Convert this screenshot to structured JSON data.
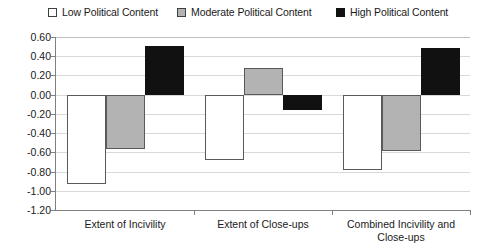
{
  "chart_data": {
    "type": "bar",
    "title": "",
    "subtitle": "",
    "xlabel": "",
    "ylabel": "",
    "categories": [
      "Extent of Incivility",
      "Extent of Close-ups",
      "Combined Incivility and Close-ups"
    ],
    "category_labels_wrapped": [
      [
        "Extent of Incivility"
      ],
      [
        "Extent of Close-ups"
      ],
      [
        "Combined Incivility and",
        "Close-ups"
      ]
    ],
    "series": [
      {
        "name": "Low Political Content",
        "color": "#ffffff",
        "values": [
          -0.93,
          -0.68,
          -0.78
        ]
      },
      {
        "name": "Moderate Political Content",
        "color": "#b3b3b3",
        "values": [
          -0.57,
          0.28,
          -0.59
        ]
      },
      {
        "name": "High Political Content",
        "color": "#111111",
        "values": [
          0.51,
          -0.16,
          0.49
        ]
      }
    ],
    "ylim": [
      -1.2,
      0.6
    ],
    "ytick_values": [
      0.6,
      0.4,
      0.2,
      0.0,
      -0.2,
      -0.4,
      -0.6,
      -0.8,
      -1.0,
      -1.2
    ],
    "ytick_labels": [
      "0.60",
      "0.40",
      "0.20",
      "0.00",
      "-0.20",
      "-0.40",
      "-0.60",
      "-0.80",
      "-1.00",
      "-1.20"
    ],
    "grid": true,
    "legend_position": "top"
  },
  "legend": {
    "items": [
      {
        "label": "Low Political Content",
        "swatch": "low-swatch-icon"
      },
      {
        "label": "Moderate Political Content",
        "swatch": "moderate-swatch-icon"
      },
      {
        "label": "High Political Content",
        "swatch": "high-swatch-icon"
      }
    ]
  },
  "colors": {
    "low": "#ffffff",
    "moderate": "#b3b3b3",
    "high": "#111111",
    "gridline": "#d9d9d9",
    "axis": "#808080",
    "text": "#1a1a1a"
  }
}
